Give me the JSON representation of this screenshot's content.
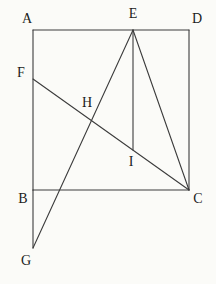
{
  "canvas": {
    "width": 216,
    "height": 284,
    "background": "#fbfbf8"
  },
  "style": {
    "line_color": "#3c3c3c",
    "line_width": 1.1,
    "label_color": "#1c1c1c",
    "label_font_size": 14
  },
  "points": {
    "A": [
      33,
      30
    ],
    "D": [
      189,
      30
    ],
    "B": [
      33,
      190
    ],
    "C": [
      189,
      190
    ],
    "E": [
      133,
      30
    ],
    "F": [
      33,
      79
    ],
    "G": [
      33,
      248
    ],
    "H": [
      91,
      121
    ],
    "I": [
      133,
      150
    ]
  },
  "segments": [
    {
      "from": "A",
      "to": "D"
    },
    {
      "from": "A",
      "to": "B"
    },
    {
      "from": "B",
      "to": "C"
    },
    {
      "from": "D",
      "to": "C"
    },
    {
      "from": "B",
      "to": "G"
    },
    {
      "from": "E",
      "to": "C"
    },
    {
      "from": "E",
      "to": "G"
    },
    {
      "from": "F",
      "to": "C"
    },
    {
      "from": "E",
      "to": "I"
    }
  ],
  "labels": [
    {
      "text": "A",
      "x": 27,
      "y": 18
    },
    {
      "text": "E",
      "x": 133,
      "y": 13
    },
    {
      "text": "D",
      "x": 197,
      "y": 18
    },
    {
      "text": "F",
      "x": 21,
      "y": 72
    },
    {
      "text": "H",
      "x": 87,
      "y": 102
    },
    {
      "text": "I",
      "x": 131,
      "y": 161
    },
    {
      "text": "B",
      "x": 23,
      "y": 198
    },
    {
      "text": "C",
      "x": 198,
      "y": 198
    },
    {
      "text": "G",
      "x": 26,
      "y": 260
    }
  ]
}
